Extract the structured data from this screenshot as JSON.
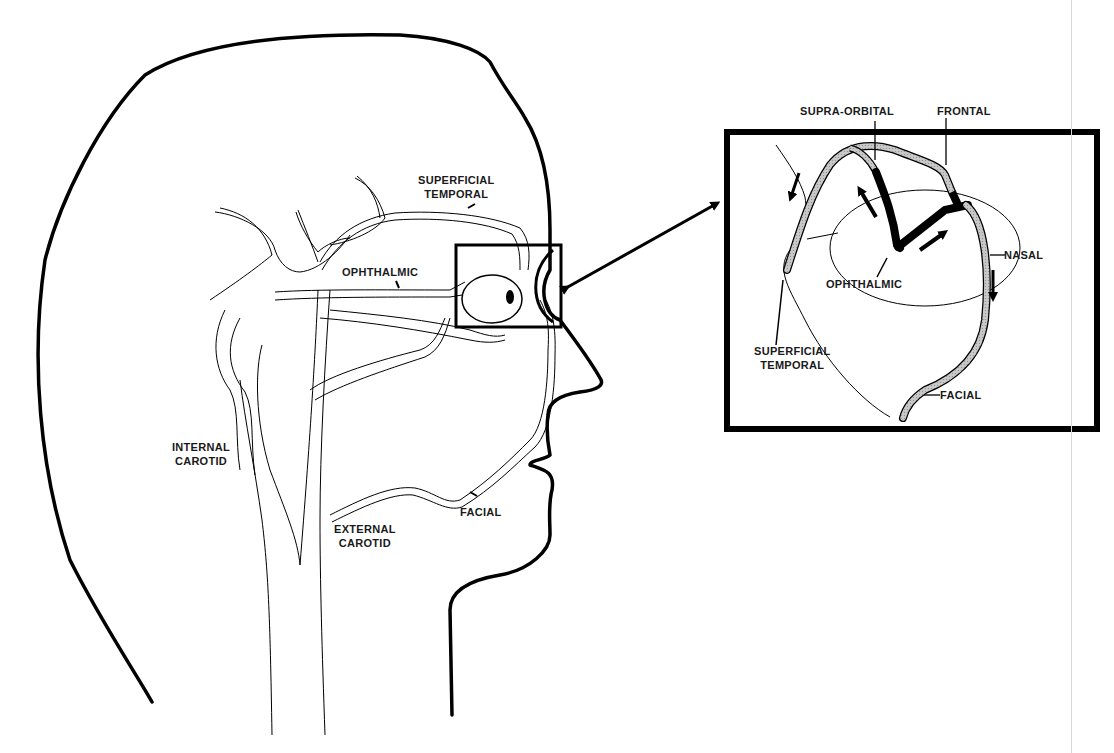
{
  "diagram": {
    "main_view": {
      "labels": {
        "superficial_temporal": [
          "SUPERFICIAL",
          "TEMPORAL"
        ],
        "ophthalmic": "OPHTHALMIC",
        "internal_carotid": [
          "INTERNAL",
          "CAROTID"
        ],
        "external_carotid": [
          "EXTERNAL",
          "CAROTID"
        ],
        "facial": "FACIAL"
      }
    },
    "inset_view": {
      "labels": {
        "supra_orbital": "SUPRA-ORBITAL",
        "frontal": "FRONTAL",
        "nasal": "NASAL",
        "ophthalmic": "OPHTHALMIC",
        "superficial_temporal": [
          "SUPERFICIAL",
          "TEMPORAL"
        ],
        "facial": "FACIAL"
      },
      "flow_arrows": [
        "up-left (supra-orbital)",
        "up-right (ophthalmic to frontal)",
        "down (nasal)",
        "down-left (superficial temporal)"
      ]
    },
    "colors": {
      "outline": "#000000",
      "vessel_fill": "#ffffff",
      "inset_vessel_fill": "#bdbdbd",
      "background": "#ffffff"
    }
  }
}
